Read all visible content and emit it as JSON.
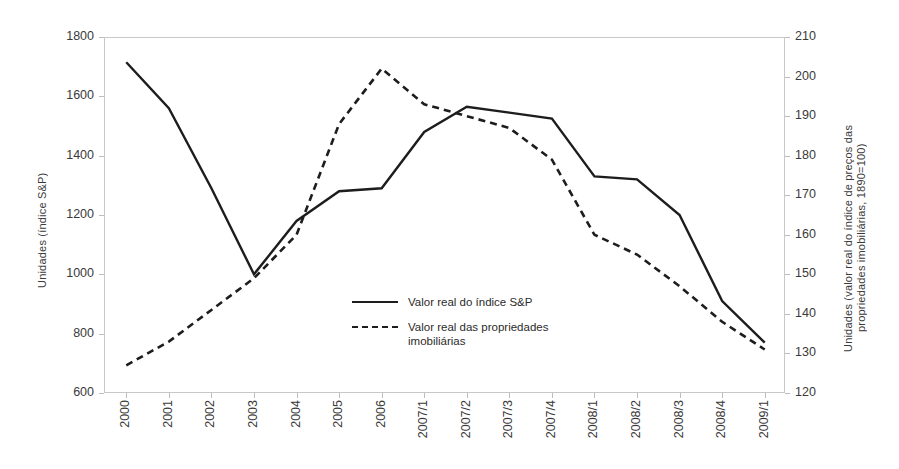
{
  "chart_data": {
    "type": "line",
    "title": "",
    "xlabel": "",
    "ylabel": "Unidades (índice S&P)",
    "y2label": "Unidades (valor real do índice de preços das propriedades imobiliárias, 1890=100)",
    "grid": false,
    "legend_position": "inside-center",
    "categories": [
      "2000",
      "2001",
      "2002",
      "2003",
      "2004",
      "2005",
      "2006",
      "2007/1",
      "2007/2",
      "2007/3",
      "2007/4",
      "2008/1",
      "2008/2",
      "2008/3",
      "2008/4",
      "2009/1"
    ],
    "ylim": [
      600,
      1800
    ],
    "yticks": [
      600,
      800,
      1000,
      1200,
      1400,
      1600,
      1800
    ],
    "y2lim": [
      120,
      210
    ],
    "y2ticks": [
      120,
      130,
      140,
      150,
      160,
      170,
      180,
      190,
      200,
      210
    ],
    "series": [
      {
        "name": "Valor real do índice S&P",
        "axis": "left",
        "style": "solid",
        "color": "#1d1d1d",
        "values": [
          1715,
          1560,
          1290,
          1000,
          1180,
          1280,
          1290,
          1480,
          1565,
          1545,
          1525,
          1330,
          1320,
          1200,
          910,
          770
        ]
      },
      {
        "name": "Valor real das propriedades imobiliárias",
        "axis": "right",
        "style": "dashed",
        "color": "#1d1d1d",
        "values": [
          127,
          133,
          141,
          149,
          160,
          188,
          202,
          193,
          190,
          187,
          179,
          160,
          155,
          147,
          138,
          131
        ]
      }
    ]
  },
  "legend": {
    "items": [
      {
        "label": "Valor real do índice S&P",
        "style": "solid"
      },
      {
        "label": "Valor real das propriedades\nimobiliárias",
        "style": "dashed"
      }
    ]
  },
  "axes": {
    "left_title": "Unidades (índice S&P)",
    "right_title": "Unidades (valor real do índice de preços das\npropriedades imobiliárias, 1890=100)"
  }
}
